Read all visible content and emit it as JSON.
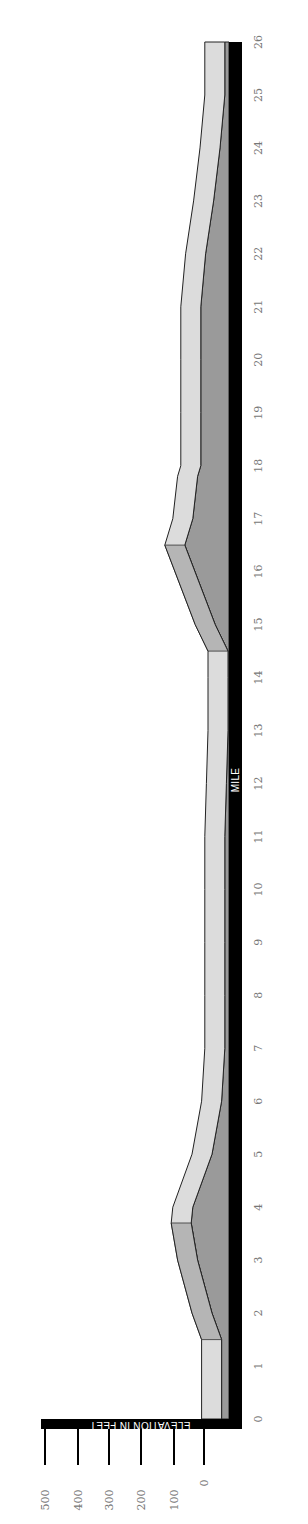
{
  "chart_data": {
    "type": "area",
    "title": "",
    "orientation": "rotated-90-clockwise",
    "xlabel": "MILE",
    "ylabel": "ELEVATION IN FEET",
    "x_ticks": [
      0,
      1,
      2,
      3,
      4,
      5,
      6,
      7,
      8,
      9,
      10,
      11,
      12,
      13,
      14,
      15,
      16,
      17,
      18,
      19,
      20,
      21,
      22,
      23,
      24,
      25,
      26
    ],
    "y_ticks": [
      0,
      100,
      200,
      300,
      400,
      500
    ],
    "xlim": [
      0,
      26
    ],
    "ylim": [
      0,
      500
    ],
    "grid": false,
    "legend": null,
    "series": [
      {
        "name": "Course elevation (ft)",
        "x": [
          0,
          1,
          1.5,
          2,
          3,
          3.7,
          4,
          5,
          6,
          7,
          8,
          9,
          10,
          11,
          12,
          13,
          14,
          14.5,
          15,
          16.5,
          17,
          17.8,
          18,
          19,
          20,
          21,
          22,
          23,
          24,
          25,
          26
        ],
        "values": [
          20,
          20,
          20,
          50,
          95,
          115,
          110,
          50,
          20,
          10,
          10,
          10,
          10,
          10,
          5,
          0,
          0,
          0,
          40,
          135,
          110,
          95,
          85,
          85,
          85,
          85,
          70,
          45,
          25,
          10,
          10
        ]
      }
    ],
    "colors": {
      "top_surface": "#dcdcdc",
      "front_face": "#9a9a9a",
      "front_face_shadow": "#8a8a8a",
      "base_bar": "#000000",
      "outline": "#222222",
      "tick_label": "#777777"
    }
  }
}
